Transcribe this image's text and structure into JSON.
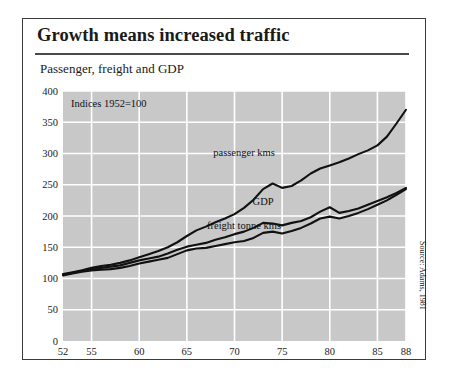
{
  "figure": {
    "title": "Growth means increased traffic",
    "subtitle": "Passenger, freight and GDP",
    "annotation": "Indices 1952=100",
    "source": "Source: Adams, 1981"
  },
  "chart_data": {
    "type": "line",
    "title": "Growth means increased traffic",
    "subtitle": "Passenger, freight and GDP",
    "annotation": "Indices 1952=100",
    "xlabel": "",
    "ylabel": "",
    "xlim": [
      52,
      88
    ],
    "ylim": [
      0,
      400
    ],
    "ytick_step": 50,
    "yticks": [
      0,
      50,
      100,
      150,
      200,
      250,
      300,
      350,
      400
    ],
    "xticks": [
      52,
      55,
      60,
      65,
      70,
      75,
      80,
      85,
      88
    ],
    "grid": true,
    "grid_color": "#ffffff",
    "plot_background": "#c8c8c8",
    "line_color": "#111111",
    "legend": "inline-labels",
    "x": [
      52,
      53,
      54,
      55,
      56,
      57,
      58,
      59,
      60,
      61,
      62,
      63,
      64,
      65,
      66,
      67,
      68,
      69,
      70,
      71,
      72,
      73,
      74,
      75,
      76,
      77,
      78,
      79,
      80,
      81,
      82,
      83,
      84,
      85,
      86,
      87,
      88
    ],
    "series": [
      {
        "name": "passenger kms",
        "label": "passenger kms",
        "label_x": 71,
        "label_y": 296,
        "values": [
          107,
          110,
          113,
          117,
          120,
          122,
          125,
          129,
          134,
          139,
          144,
          150,
          158,
          168,
          177,
          183,
          190,
          196,
          203,
          213,
          226,
          243,
          252,
          245,
          248,
          257,
          268,
          276,
          281,
          286,
          292,
          299,
          305,
          313,
          327,
          348,
          370
        ]
      },
      {
        "name": "GDP",
        "label": "GDP",
        "label_x": 73,
        "label_y": 217,
        "values": [
          106,
          109,
          112,
          115,
          117,
          119,
          121,
          125,
          129,
          132,
          135,
          140,
          146,
          151,
          154,
          157,
          162,
          166,
          171,
          175,
          181,
          189,
          188,
          185,
          189,
          192,
          198,
          207,
          214,
          205,
          208,
          212,
          218,
          224,
          230,
          237,
          245
        ]
      },
      {
        "name": "freight tonne kms",
        "label": "freight tonne kms",
        "label_x": 71,
        "label_y": 180,
        "values": [
          105,
          108,
          111,
          113,
          114,
          115,
          117,
          120,
          124,
          127,
          130,
          133,
          139,
          145,
          148,
          149,
          152,
          155,
          158,
          160,
          165,
          173,
          175,
          172,
          176,
          181,
          188,
          196,
          199,
          196,
          200,
          205,
          211,
          218,
          225,
          234,
          243
        ]
      }
    ]
  }
}
